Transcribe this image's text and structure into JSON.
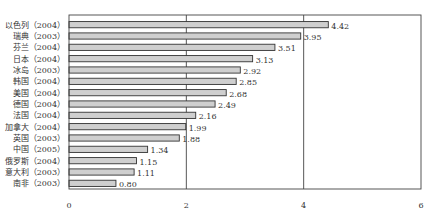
{
  "chart_data": {
    "type": "bar",
    "orientation": "horizontal",
    "title": "",
    "xlabel": "",
    "ylabel": "",
    "categories": [
      "以色列（2004）",
      "瑞典（2003）",
      "芬兰（2004）",
      "日本（2004）",
      "冰岛（2003）",
      "韩国（2004）",
      "美国（2004）",
      "德国（2004）",
      "法国（2004）",
      "加拿大（2004）",
      "英国（2003）",
      "中国（2005）",
      "俄罗斯（2004）",
      "意大利（2003）",
      "南非（2003）"
    ],
    "values": [
      4.42,
      3.95,
      3.51,
      3.13,
      2.92,
      2.85,
      2.68,
      2.49,
      2.16,
      1.99,
      1.88,
      1.34,
      1.15,
      1.11,
      0.8
    ],
    "value_labels": [
      "4.42",
      "3.95",
      "3.51",
      "3.13",
      "2.92",
      "2.85",
      "2.68",
      "2.49",
      "2.16",
      "1.99",
      "1.88",
      "1.34",
      "1.15",
      "1.11",
      "0.80"
    ],
    "xlim": [
      0,
      6
    ],
    "xticks": [
      0,
      2,
      4,
      6
    ],
    "xtick_labels": [
      "0",
      "2",
      "4",
      "6"
    ],
    "grid": "vertical lines at 2 and 4",
    "legend": "none",
    "colors": {
      "bar_fill": "#cfcfcf",
      "bar_stroke": "#333333",
      "axis": "#444444"
    }
  }
}
